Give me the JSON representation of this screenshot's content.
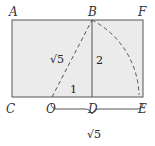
{
  "diagram": {
    "colors": {
      "fill": "#ebebeb",
      "stroke": "#444444",
      "text": "#333333"
    },
    "points": {
      "A": "A",
      "B": "B",
      "F": "F",
      "C": "C",
      "O": "O",
      "D": "D",
      "E": "E"
    },
    "labels": {
      "hyp": "√5",
      "bd": "2",
      "od": "1",
      "brace": "√5"
    }
  }
}
